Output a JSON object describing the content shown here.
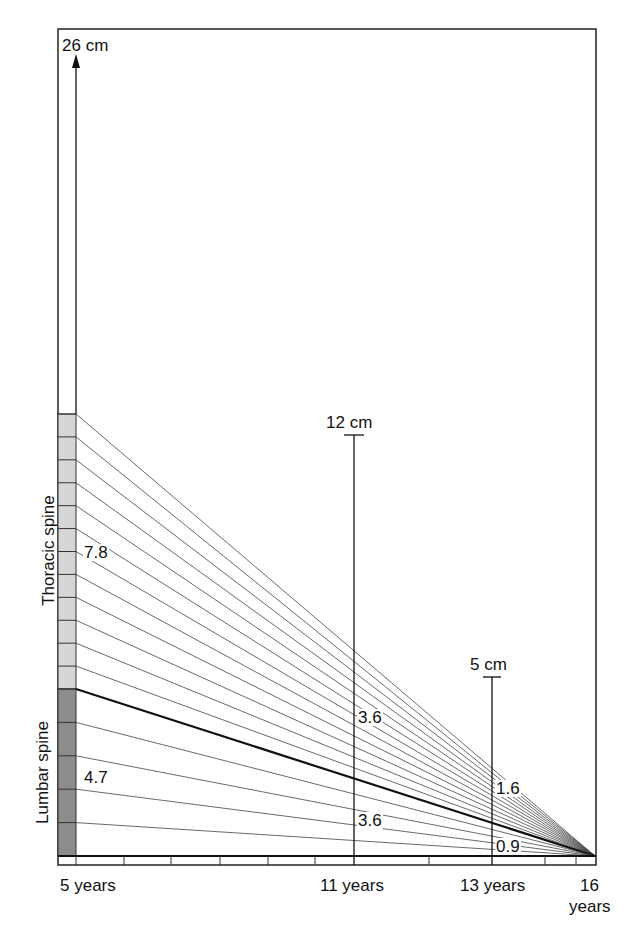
{
  "top_marker": {
    "label": "26 cm"
  },
  "markers": [
    {
      "label": "12 cm",
      "age": 11
    },
    {
      "label": "5 cm",
      "age": 13
    }
  ],
  "regions": {
    "thoracic": {
      "label": "Thoracic spine",
      "segments": 12,
      "color": "#d6d6d6"
    },
    "lumbar": {
      "label": "Lumbar spine",
      "segments": 5,
      "color": "#8c8c8c"
    }
  },
  "value_labels": {
    "thoracic_at_5": "7.8",
    "lumbar_at_5": "4.7",
    "thoracic_at_11": "3.6",
    "lumbar_at_11": "3.6",
    "thoracic_at_13": "1.6",
    "lumbar_at_13": "0.9"
  },
  "x_axis": {
    "labels": [
      {
        "text": "5 years",
        "age": 5
      },
      {
        "text": "11 years",
        "age": 11
      },
      {
        "text": "13 years",
        "age": 13
      },
      {
        "text": "16",
        "age": 16,
        "sub": "years"
      }
    ]
  },
  "chart_data": {
    "type": "line",
    "xlabel": "Age (years)",
    "ylabel": "Remaining growth (cm)",
    "x": [
      5,
      11,
      13,
      16
    ],
    "series": [
      {
        "name": "Total spine T1–S1 remaining",
        "values": [
          12.5,
          7.2,
          2.5,
          0
        ]
      },
      {
        "name": "Thoracic spine remaining",
        "values": [
          7.8,
          3.6,
          1.6,
          0
        ]
      },
      {
        "name": "Lumbar spine remaining",
        "values": [
          4.7,
          3.6,
          0.9,
          0
        ]
      }
    ],
    "annotations": [
      "26 cm",
      "12 cm at 11 years",
      "5 cm at 13 years"
    ],
    "xlim": [
      5,
      16
    ]
  }
}
